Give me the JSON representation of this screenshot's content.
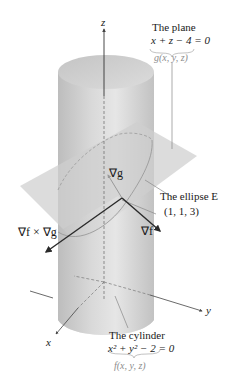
{
  "diagram": {
    "axes": {
      "z_label": "z",
      "y_label": "y",
      "x_label": "x"
    },
    "plane_label": {
      "title": "The plane",
      "equation": "x + z − 4 = 0",
      "function": "g(x, y, z)"
    },
    "cylinder_label": {
      "title": "The cylinder",
      "equation": "x² + y² − 2 = 0",
      "function": "f(x, y, z)"
    },
    "ellipse_label": "The ellipse E",
    "point_label": "(1, 1, 3)",
    "vectors": {
      "grad_g": "∇g",
      "grad_f": "∇f",
      "cross": "∇f × ∇g"
    },
    "colors": {
      "cylinder": "#c8c8c8",
      "plane": "#d9d9d9",
      "vector": "#2a2a2a",
      "annotation_line": "#888888"
    }
  }
}
